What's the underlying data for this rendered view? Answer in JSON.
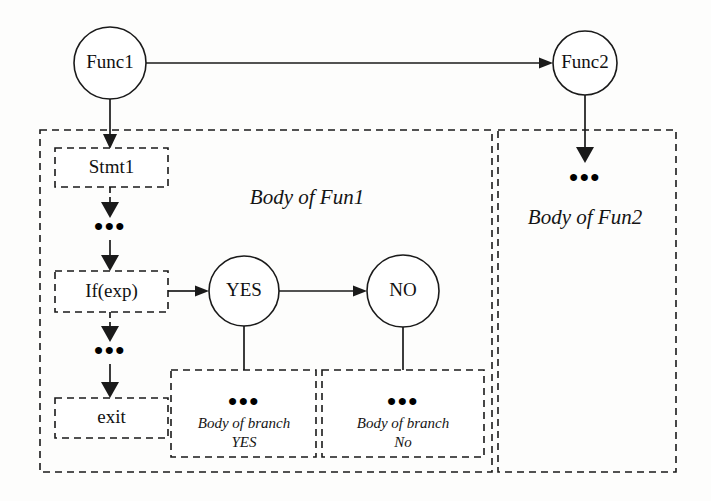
{
  "diagram": {
    "colors": {
      "stroke": "#1a1a1a",
      "background": "#fdfdfc",
      "text": "#111111"
    },
    "nodes": {
      "func1": {
        "label": "Func1",
        "shape": "circle"
      },
      "func2": {
        "label": "Func2",
        "shape": "circle"
      },
      "yes": {
        "label": "YES",
        "shape": "circle"
      },
      "no": {
        "label": "NO",
        "shape": "circle"
      },
      "stmt1": {
        "label": "Stmt1",
        "shape": "dashed-box"
      },
      "ifexp": {
        "label": "If(exp)",
        "shape": "dashed-box"
      },
      "exit": {
        "label": "exit",
        "shape": "dashed-box"
      }
    },
    "panels": {
      "fun1": {
        "label": "Body of Fun1"
      },
      "fun2": {
        "label": "Body of Fun2"
      }
    },
    "branches": {
      "yes_body": {
        "line1": "Body of branch",
        "line2": "YES"
      },
      "no_body": {
        "line1": "Body of branch",
        "line2": "No"
      }
    },
    "ellipsis": {
      "after_stmt1": "•••",
      "after_ifexp": "•••",
      "in_fun2": "•••",
      "in_yes_body": "•••",
      "in_no_body": "•••"
    }
  }
}
